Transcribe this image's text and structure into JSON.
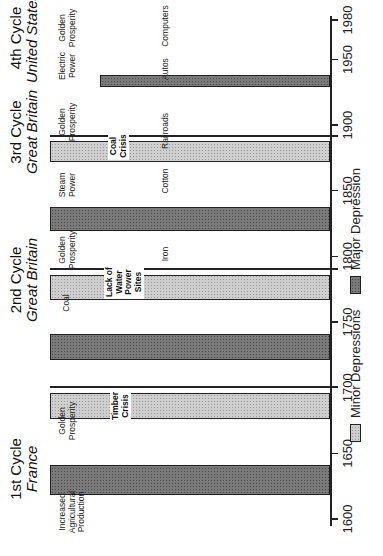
{
  "chart_data": {
    "type": "bar",
    "orientation": "rotated-90",
    "title": "",
    "xlabel": "",
    "ylabel": "",
    "x_range": [
      1600,
      1980
    ],
    "x_ticks": [
      1600,
      1650,
      1700,
      1750,
      1800,
      1850,
      1900,
      1950,
      1980
    ],
    "grid": false,
    "legend_position": "bottom",
    "legend": [
      {
        "name": "Minor Depressions",
        "fill": "light-stipple"
      },
      {
        "name": "Major Depression",
        "fill": "dark-stipple"
      }
    ],
    "cycles": [
      {
        "title": "1st Cycle",
        "country": "France",
        "phases": [
          "Increased Agricultural Production",
          "Golden Prosperity"
        ],
        "major_depression": {
          "start": 1618,
          "end": 1641
        },
        "minor_depression": {
          "start": 1676,
          "end": 1696,
          "crisis": "Timber Crisis"
        },
        "cycle_end": 1700
      },
      {
        "title": "2nd Cycle",
        "country": "Great Britain",
        "phases": [
          "Coal",
          "Golden Prosperity"
        ],
        "industry": "Iron",
        "major_depression": {
          "start": 1721,
          "end": 1741
        },
        "minor_depression": {
          "start": 1767,
          "end": 1786,
          "crisis": "Lack of Water Power Sites"
        },
        "cycle_end": 1790
      },
      {
        "title": "3rd Cycle",
        "country": "Great Britain",
        "phases": [
          "Steam Power",
          "Golden Prosperity"
        ],
        "industry_early": "Cotton",
        "industry": "Railroads",
        "major_depression": {
          "start": 1819,
          "end": 1838
        },
        "minor_depression": {
          "start": 1872,
          "end": 1888,
          "crisis": "Coal Crisis"
        },
        "cycle_end": 1891
      },
      {
        "title": "4th Cycle",
        "country": "United States",
        "phases": [
          "Electric Power",
          "Golden Prosperity"
        ],
        "industry_early": "Autos",
        "industry": "Computers",
        "major_depression": {
          "start": 1929,
          "end": 1938
        }
      }
    ]
  },
  "axis": {
    "ticks": [
      {
        "label": "1600",
        "year": 1600
      },
      {
        "label": "1650",
        "year": 1650
      },
      {
        "label": "1700",
        "year": 1700
      },
      {
        "label": "1750",
        "year": 1750
      },
      {
        "label": "1800",
        "year": 1800
      },
      {
        "label": "1850",
        "year": 1850
      },
      {
        "label": "1900",
        "year": 1900
      },
      {
        "label": "1950",
        "year": 1950
      },
      {
        "label": "1980",
        "year": 1980
      }
    ]
  },
  "titles": {
    "c1": {
      "cycle": "1st Cycle",
      "country": "France"
    },
    "c2": {
      "cycle": "2nd Cycle",
      "country": "Great Britain"
    },
    "c3": {
      "cycle": "3rd Cycle",
      "country": "Great Britain"
    },
    "c4": {
      "cycle": "4th Cycle",
      "country": "United States"
    }
  },
  "labels": {
    "agri": "Increased\nAgricultural\nProduction",
    "gp1": "Golden\nProsperity",
    "coal": "Coal",
    "gp2": "Golden\nProsperity",
    "steam": "Steam\nPower",
    "gp3": "Golden\nProsperity",
    "electric": "Electric\nPower",
    "gp4": "Golden\nProsperity",
    "iron": "Iron",
    "cotton": "Cotton",
    "railroads": "Railroads",
    "autos": "Autos",
    "computers": "Computers",
    "crisis1": "Timber\nCrisis",
    "crisis2": "Lack of\nWater\nPower\nSites",
    "crisis3": "Coal\nCrisis"
  },
  "legend": {
    "minor": "Minor Depressions",
    "major": "Major Depression"
  }
}
